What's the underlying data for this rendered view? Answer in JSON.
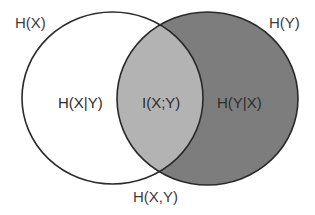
{
  "diagram": {
    "type": "venn",
    "sets": [
      {
        "id": "X",
        "label": "H(X)"
      },
      {
        "id": "Y",
        "label": "H(Y)"
      }
    ],
    "regions": {
      "x_only": "H(X|Y)",
      "intersection": "I(X;Y)",
      "y_only": "H(Y|X)",
      "union": "H(X,Y)"
    },
    "colors": {
      "background": "#ffffff",
      "x_only_fill": "#ffffff",
      "intersection_fill": "#b3b3b3",
      "y_only_fill": "#7d7d7d",
      "stroke": "#2a2a2a",
      "text": "#3c3c3c"
    }
  }
}
